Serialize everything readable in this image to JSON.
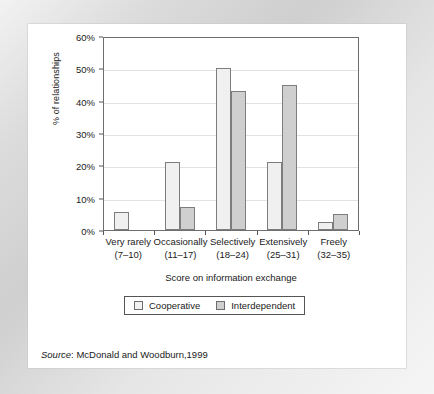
{
  "chart_data": {
    "type": "bar",
    "title": "",
    "xlabel": "Score on information exchange",
    "ylabel": "% of relationships",
    "categories": [
      "Very rarely\n(7–10)",
      "Occasionally\n(11–17)",
      "Selectively\n(18–24)",
      "Extensively\n(25–31)",
      "Freely\n(32–35)"
    ],
    "category_lines": [
      [
        "Very rarely",
        "(7–10)"
      ],
      [
        "Occasionally",
        "(11–17)"
      ],
      [
        "Selectively",
        "(18–24)"
      ],
      [
        "Extensively",
        "(25–31)"
      ],
      [
        "Freely",
        "(32–35)"
      ]
    ],
    "series": [
      {
        "name": "Cooperative",
        "values": [
          5.5,
          21,
          50,
          21,
          2.5
        ]
      },
      {
        "name": "Interdependent",
        "values": [
          0,
          7,
          43,
          45,
          5
        ]
      }
    ],
    "ylim": [
      0,
      60
    ],
    "yticks": [
      0,
      10,
      20,
      30,
      40,
      50,
      60
    ],
    "ytick_labels": [
      "0%",
      "10%",
      "20%",
      "30%",
      "40%",
      "50%",
      "60%"
    ],
    "grid": true,
    "grid_axis": "y",
    "legend_position": "below-axis",
    "colors": {
      "cooperative": "#f0f0f0",
      "interdependent": "#cfcfcf",
      "bar_edge": "#7d7d7d",
      "axis": "#6e6e6e",
      "gridline": "#e2e2e2",
      "text": "#1a1a1a",
      "frame": "#dcdcdc"
    }
  },
  "legend": {
    "entries": [
      {
        "label": "Cooperative",
        "swatch": "legend-swatch-cooperative"
      },
      {
        "label": "Interdependent",
        "swatch": "legend-swatch-interdependent"
      }
    ]
  },
  "source": {
    "prefix": "Source",
    "separator": ": ",
    "text": "McDonald and Woodburn,1999",
    "full": "Source: McDonald and Woodburn,1999"
  }
}
